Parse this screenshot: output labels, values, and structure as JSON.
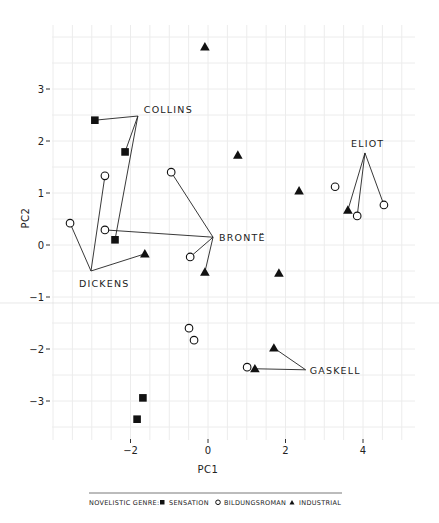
{
  "chart_data": {
    "type": "scatter",
    "title": "",
    "xlabel": "PC1",
    "ylabel": "PC2",
    "xlim": [
      -3.9,
      5.5
    ],
    "ylim": [
      -3.75,
      4.25
    ],
    "xticks": [
      -2,
      0,
      2,
      4
    ],
    "yticks": [
      3,
      2,
      1,
      0,
      -1,
      -2,
      -3
    ],
    "grid": true,
    "legend": {
      "position": "bottom",
      "title": "NOVELISTIC GENRE:",
      "entries": [
        {
          "name": "SENSATION",
          "marker": "square-filled"
        },
        {
          "name": "BILDUNGSROMAN",
          "marker": "circle-open"
        },
        {
          "name": "INDUSTRIAL",
          "marker": "triangle-filled"
        }
      ]
    },
    "series": [
      {
        "name": "SENSATION",
        "marker": "square-filled",
        "points": [
          {
            "x": -2.92,
            "y": 2.4,
            "author": "COLLINS"
          },
          {
            "x": -2.14,
            "y": 1.79,
            "author": "COLLINS"
          },
          {
            "x": -2.4,
            "y": 0.1,
            "author": "COLLINS"
          },
          {
            "x": -1.68,
            "y": -2.94,
            "author": ""
          },
          {
            "x": -1.83,
            "y": -3.35,
            "author": ""
          }
        ]
      },
      {
        "name": "BILDUNGSROMAN",
        "marker": "circle-open",
        "points": [
          {
            "x": -2.66,
            "y": 1.33,
            "author": "DICKENS"
          },
          {
            "x": -3.56,
            "y": 0.42,
            "author": "DICKENS"
          },
          {
            "x": -2.66,
            "y": 0.29,
            "author": "BRONTË"
          },
          {
            "x": -0.95,
            "y": 1.4,
            "author": "BRONTË"
          },
          {
            "x": -0.46,
            "y": -0.23,
            "author": "BRONTË"
          },
          {
            "x": 3.28,
            "y": 1.12,
            "author": ""
          },
          {
            "x": 3.85,
            "y": 0.56,
            "author": "ELIOT"
          },
          {
            "x": 4.54,
            "y": 0.77,
            "author": "ELIOT"
          },
          {
            "x": -0.49,
            "y": -1.6,
            "author": ""
          },
          {
            "x": -0.36,
            "y": -1.83,
            "author": ""
          },
          {
            "x": 1.01,
            "y": -2.35,
            "author": ""
          }
        ]
      },
      {
        "name": "INDUSTRIAL",
        "marker": "triangle-filled",
        "points": [
          {
            "x": -0.08,
            "y": 3.81,
            "author": ""
          },
          {
            "x": 0.77,
            "y": 1.73,
            "author": ""
          },
          {
            "x": 2.35,
            "y": 1.04,
            "author": ""
          },
          {
            "x": 3.61,
            "y": 0.67,
            "author": "ELIOT"
          },
          {
            "x": -1.63,
            "y": -0.17,
            "author": "DICKENS"
          },
          {
            "x": -0.08,
            "y": -0.52,
            "author": "BRONTË"
          },
          {
            "x": 1.83,
            "y": -0.54,
            "author": ""
          },
          {
            "x": 1.7,
            "y": -1.98,
            "author": "GASKELL"
          },
          {
            "x": 1.21,
            "y": -2.38,
            "author": "GASKELL"
          }
        ]
      }
    ],
    "annotations": [
      {
        "label": "COLLINS",
        "anchor": {
          "x": -1.81,
          "y": 2.48
        },
        "label_offset": [
          6,
          -3
        ],
        "targets": [
          {
            "x": -2.92,
            "y": 2.4
          },
          {
            "x": -2.14,
            "y": 1.79
          },
          {
            "x": -2.4,
            "y": 0.1
          }
        ]
      },
      {
        "label": "DICKENS",
        "anchor": {
          "x": -3.02,
          "y": -0.5
        },
        "label_offset": [
          -12,
          16
        ],
        "targets": [
          {
            "x": -3.56,
            "y": 0.42
          },
          {
            "x": -2.66,
            "y": 1.33
          },
          {
            "x": -1.63,
            "y": -0.17
          }
        ]
      },
      {
        "label": "BRONTË",
        "anchor": {
          "x": 0.13,
          "y": 0.15
        },
        "label_offset": [
          6,
          4
        ],
        "targets": [
          {
            "x": -0.95,
            "y": 1.4
          },
          {
            "x": -2.66,
            "y": 0.29
          },
          {
            "x": -0.46,
            "y": -0.23
          },
          {
            "x": -0.08,
            "y": -0.52
          }
        ]
      },
      {
        "label": "ELIOT",
        "anchor": {
          "x": 4.05,
          "y": 1.77
        },
        "label_offset": [
          -14,
          -6
        ],
        "targets": [
          {
            "x": 3.61,
            "y": 0.67
          },
          {
            "x": 3.85,
            "y": 0.56
          },
          {
            "x": 4.54,
            "y": 0.77
          }
        ]
      },
      {
        "label": "GASKELL",
        "anchor": {
          "x": 2.52,
          "y": -2.4
        },
        "label_offset": [
          4,
          4
        ],
        "targets": [
          {
            "x": 1.7,
            "y": -1.98
          },
          {
            "x": 1.21,
            "y": -2.38
          }
        ]
      }
    ]
  }
}
